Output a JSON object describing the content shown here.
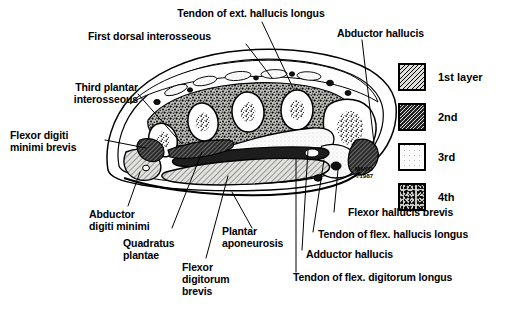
{
  "figure": {
    "credit_line1": "MAYO",
    "credit_line2": "©1987"
  },
  "labels": {
    "tendon_ext_hallucis_longus": "Tendon of ext. hallucis longus",
    "first_dorsal_interosseous": "First dorsal interosseous",
    "abductor_hallucis": "Abductor hallucis",
    "third_plantar_interosseous": "Third plantar\ninterosseous",
    "flexor_digiti_minimi_brevis": "Flexor digiti\nminimi brevis",
    "abductor_digiti_minimi": "Abductor\ndigiti minimi",
    "quadratus_plantae": "Quadratus\nplantae",
    "flexor_digitorum_brevis": "Flexor\ndigitorum\nbrevis",
    "plantar_aponeurosis": "Plantar\naponeurosis",
    "flexor_hallucis_brevis": "Flexor hallucis brevis",
    "tendon_flex_hallucis_longus": "Tendon of flex. hallucis longus",
    "adductor_hallucis": "Adductor hallucis",
    "tendon_flex_digitorum_longus": "Tendon of flex. digitorum longus"
  },
  "legend": {
    "items": [
      {
        "label": "1st layer",
        "pattern": "diagonal-hatch-light",
        "swatch_class": "sw-1"
      },
      {
        "label": "2nd",
        "pattern": "diagonal-hatch-dark",
        "swatch_class": "sw-2"
      },
      {
        "label": "3rd",
        "pattern": "fine-stipple-white",
        "swatch_class": "sw-3"
      },
      {
        "label": "4th",
        "pattern": "dense-mottled",
        "swatch_class": "sw-4"
      }
    ]
  },
  "colors": {
    "ink": "#000000",
    "paper": "#ffffff"
  }
}
